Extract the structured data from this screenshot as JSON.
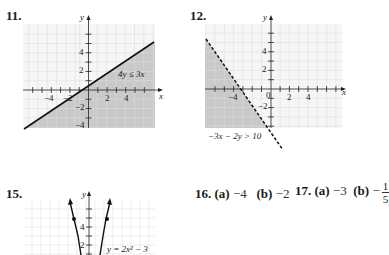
{
  "problems": {
    "p11": {
      "number": "11.",
      "axis_x": "x",
      "axis_y": "y",
      "x_ticks": [
        "−4",
        "−2",
        "2",
        "4"
      ],
      "y_ticks": [
        "4",
        "2",
        "−2",
        "−4"
      ],
      "label": "4y ≤ 3x",
      "boundary": "solid",
      "shading": "below line"
    },
    "p12": {
      "number": "12.",
      "axis_x": "x",
      "axis_y": "y",
      "x_ticks": [
        "−4",
        "0",
        "2",
        "4"
      ],
      "y_ticks": [
        "4",
        "2",
        "−2"
      ],
      "label": "−3x − 2y > 10",
      "boundary": "dashed",
      "shading": "left of line"
    },
    "p15": {
      "number": "15.",
      "axis_y": "y",
      "y_ticks": [
        "4",
        "2"
      ],
      "label": "y = 2x² − 3"
    },
    "p16": {
      "number": "16.",
      "a_label": "(a)",
      "a_value": "−4",
      "b_label": "(b)",
      "b_value": "−2"
    },
    "p17": {
      "number": "17.",
      "a_label": "(a)",
      "a_value": "−3",
      "b_label": "(b)",
      "b_sign": "−",
      "b_num": "1",
      "b_den": "5"
    }
  },
  "colors": {
    "grid": "#d9d9d9",
    "grid_bg": "#f4f4f4",
    "shade": "#c8c8c8",
    "line": "#1a1a1a"
  }
}
